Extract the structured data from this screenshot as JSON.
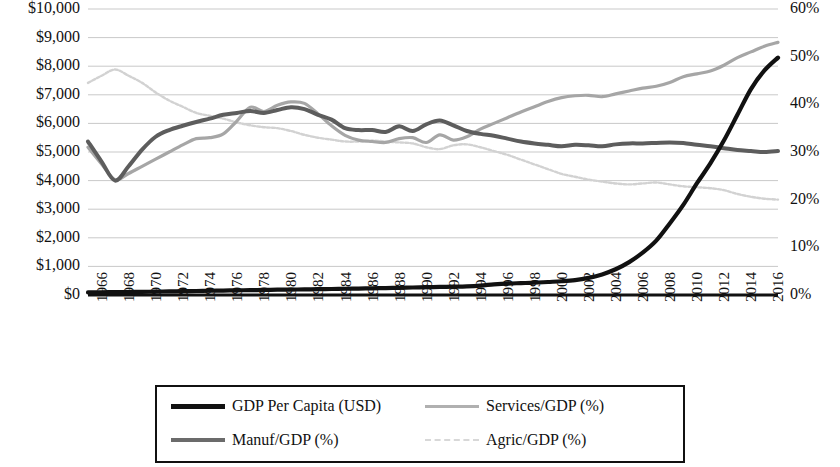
{
  "chart_data": {
    "type": "line",
    "title": "",
    "xlabel": "",
    "ylabel": "",
    "y_left_label": "",
    "y_right_label": "",
    "grid": true,
    "legend_position": "bottom",
    "x": [
      1966,
      1967,
      1968,
      1969,
      1970,
      1971,
      1972,
      1973,
      1974,
      1975,
      1976,
      1977,
      1978,
      1979,
      1980,
      1981,
      1982,
      1983,
      1984,
      1985,
      1986,
      1987,
      1988,
      1989,
      1990,
      1991,
      1992,
      1993,
      1994,
      1995,
      1996,
      1997,
      1998,
      1999,
      2000,
      2001,
      2002,
      2003,
      2004,
      2005,
      2006,
      2007,
      2008,
      2009,
      2010,
      2011,
      2012,
      2013,
      2014,
      2015,
      2016,
      2017
    ],
    "xtick_labels": [
      "1966",
      "1968",
      "1970",
      "1972",
      "1974",
      "1976",
      "1978",
      "1980",
      "1982",
      "1984",
      "1986",
      "1988",
      "1990",
      "1992",
      "1994",
      "1996",
      "1998",
      "2000",
      "2002",
      "2004",
      "2006",
      "2008",
      "2010",
      "2012",
      "2014",
      "2016"
    ],
    "y_left_ticks": [
      "$0",
      "$1,000",
      "$2,000",
      "$3,000",
      "$4,000",
      "$5,000",
      "$6,000",
      "$7,000",
      "$8,000",
      "$9,000",
      "$10,000"
    ],
    "y_right_ticks": [
      "0%",
      "10%",
      "20%",
      "30%",
      "40%",
      "50%",
      "60%"
    ],
    "ylim_left": [
      0,
      10000
    ],
    "ylim_right": [
      0,
      60
    ],
    "series": [
      {
        "name": "GDP Per Capita (USD)",
        "axis": "left",
        "color": "#111111",
        "width": 4.2,
        "dash": "",
        "values": [
          90,
          95,
          100,
          105,
          110,
          118,
          125,
          133,
          140,
          148,
          155,
          162,
          170,
          178,
          185,
          190,
          196,
          202,
          210,
          218,
          226,
          234,
          242,
          250,
          262,
          272,
          282,
          292,
          305,
          330,
          370,
          400,
          415,
          430,
          455,
          480,
          520,
          600,
          720,
          900,
          1150,
          1480,
          1900,
          2500,
          3150,
          3900,
          4600,
          5400,
          6300,
          7200,
          7850,
          8300
        ]
      },
      {
        "name": "Services/GDP (%)",
        "axis": "right",
        "color": "#a6a6a6",
        "width": 3.2,
        "dash": "",
        "values": [
          31.0,
          27.5,
          24.2,
          25.5,
          27.0,
          28.5,
          30.0,
          31.5,
          32.8,
          33.0,
          33.8,
          36.5,
          39.4,
          38.5,
          39.8,
          40.5,
          40.2,
          38.0,
          35.5,
          33.5,
          32.5,
          32.2,
          32.0,
          32.8,
          33.0,
          32.0,
          33.6,
          32.5,
          33.2,
          34.8,
          36.0,
          37.2,
          38.4,
          39.5,
          40.6,
          41.4,
          41.8,
          41.9,
          41.6,
          42.2,
          42.8,
          43.4,
          43.8,
          44.6,
          45.8,
          46.4,
          47.0,
          48.2,
          49.8,
          51.0,
          52.2,
          53.0
        ]
      },
      {
        "name": "Manuf/GDP (%)",
        "axis": "right",
        "color": "#5d5d5d",
        "width": 4.0,
        "dash": "",
        "values": [
          32.2,
          28.0,
          24.0,
          27.0,
          30.5,
          33.2,
          34.6,
          35.5,
          36.3,
          37.0,
          37.8,
          38.2,
          38.6,
          38.2,
          38.8,
          39.4,
          39.0,
          37.8,
          36.8,
          35.0,
          34.6,
          34.6,
          34.2,
          35.4,
          34.4,
          35.8,
          36.6,
          35.6,
          34.4,
          33.8,
          33.4,
          32.8,
          32.2,
          31.8,
          31.5,
          31.2,
          31.5,
          31.4,
          31.2,
          31.6,
          31.8,
          31.8,
          31.9,
          32.0,
          31.9,
          31.5,
          31.2,
          30.8,
          30.4,
          30.2,
          30.0,
          30.2
        ]
      },
      {
        "name": "Agric/GDP (%)",
        "axis": "right",
        "color": "#d2d2d2",
        "width": 2.4,
        "dash": "3 2",
        "values": [
          44.5,
          46.0,
          47.3,
          46.0,
          44.5,
          42.5,
          40.8,
          39.5,
          38.2,
          37.6,
          37.0,
          36.2,
          35.6,
          35.2,
          35.0,
          34.4,
          33.6,
          33.0,
          32.6,
          32.2,
          32.2,
          32.4,
          32.2,
          32.0,
          31.8,
          31.0,
          30.6,
          31.4,
          31.6,
          31.0,
          30.2,
          29.4,
          28.4,
          27.4,
          26.4,
          25.4,
          24.8,
          24.2,
          23.8,
          23.4,
          23.2,
          23.4,
          23.6,
          23.2,
          22.8,
          22.6,
          22.4,
          22.0,
          21.2,
          20.6,
          20.2,
          20.0
        ]
      }
    ]
  },
  "legend": {
    "entries": [
      {
        "label": "GDP Per Capita (USD)",
        "color": "#111111",
        "thickness": "5px",
        "dashed": false
      },
      {
        "label": "Services/GDP (%)",
        "color": "#b0b0b0",
        "thickness": "3px",
        "dashed": false
      },
      {
        "label": "Manuf/GDP (%)",
        "color": "#6b6b6b",
        "thickness": "4px",
        "dashed": false
      },
      {
        "label": "Agric/GDP (%)",
        "color": "#d8d8d8",
        "thickness": "2px",
        "dashed": true
      }
    ]
  }
}
